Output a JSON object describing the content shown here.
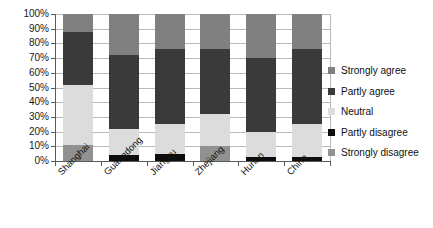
{
  "chart_data": {
    "type": "bar",
    "stacked": true,
    "stack_mode": "percent",
    "title": "",
    "subtitle": "",
    "xlabel": "",
    "ylabel": "",
    "ylim": [
      0,
      100
    ],
    "grid": true,
    "legend_position": "right",
    "categories": [
      "Shanghai",
      "Guangdong",
      "Jiangsu",
      "Zhejiang",
      "Hunan",
      "China"
    ],
    "ytick_labels": [
      "100%",
      "90%",
      "80%",
      "70%",
      "60%",
      "50%",
      "40%",
      "30%",
      "20%",
      "10%",
      "0%"
    ],
    "ytick_values": [
      100,
      90,
      80,
      70,
      60,
      50,
      40,
      30,
      20,
      10,
      0
    ],
    "series": [
      {
        "name": "Strongly agree",
        "color": "#808080",
        "values": [
          12,
          28,
          24,
          24,
          30,
          24
        ]
      },
      {
        "name": "Partly agree",
        "color": "#3a3a3a",
        "values": [
          36,
          50,
          51,
          44,
          50,
          51
        ]
      },
      {
        "name": "Neutral",
        "color": "#dcdcdc",
        "values": [
          41,
          18,
          20,
          22,
          17,
          22
        ]
      },
      {
        "name": "Partly disagree",
        "color": "#0d0d0d",
        "values": [
          0,
          4,
          5,
          0,
          3,
          3
        ]
      },
      {
        "name": "Strongly disagree",
        "color": "#919191",
        "values": [
          11,
          0,
          0,
          10,
          0,
          0
        ]
      }
    ]
  },
  "legend": {
    "items": [
      {
        "label": "Strongly agree"
      },
      {
        "label": "Partly agree"
      },
      {
        "label": "Neutral"
      },
      {
        "label": "Partly disagree"
      },
      {
        "label": "Strongly disagree"
      }
    ]
  },
  "colors": {
    "grid": "#b9b9b9",
    "axis": "#5a5a5a",
    "background": "#ffffff",
    "text": "#111111"
  }
}
